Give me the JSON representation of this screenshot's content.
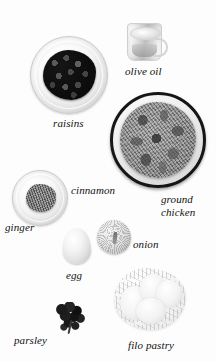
{
  "scene": {
    "title": "Ingredients layout",
    "background_color": "#fdfdfd",
    "label_color": "#111111",
    "style": "black-and-white cookbook ingredient photo with italic serif captions"
  },
  "ingredients": [
    {
      "id": "raisins",
      "label": "raisins",
      "vessel": "glass bowl",
      "icon": "raisins-bowl-icon",
      "label_position": {
        "left": 53,
        "top": 118
      },
      "label_size": 11
    },
    {
      "id": "olive-oil",
      "label": "olive oil",
      "vessel": "glass measuring jug",
      "icon": "olive-oil-jug-icon",
      "label_position": {
        "left": 125,
        "top": 66
      },
      "label_size": 11
    },
    {
      "id": "ground-chicken",
      "label": "ground\nchicken",
      "label_line1": "ground",
      "label_line2": "chicken",
      "vessel": "dark-rimmed bowl",
      "icon": "ground-chicken-bowl-icon",
      "label_position": {
        "left": 161,
        "top": 194
      },
      "label_size": 11
    },
    {
      "id": "ginger",
      "label": "ginger",
      "vessel": "glass bowl",
      "icon": "ginger-bowl-icon",
      "label_position": {
        "left": 5,
        "top": 222
      },
      "label_size": 11
    },
    {
      "id": "cinnamon",
      "label": "cinnamon",
      "vessel": "none",
      "icon": "cinnamon-icon",
      "label_position": {
        "left": 71,
        "top": 185
      },
      "label_size": 11
    },
    {
      "id": "egg",
      "label": "egg",
      "vessel": "none",
      "icon": "egg-icon",
      "label_position": {
        "left": 66,
        "top": 270
      },
      "label_size": 11
    },
    {
      "id": "onion",
      "label": "onion",
      "vessel": "none",
      "icon": "onion-icon",
      "label_position": {
        "left": 133,
        "top": 239
      },
      "label_size": 11
    },
    {
      "id": "parsley",
      "label": "parsley",
      "vessel": "none",
      "icon": "parsley-sprig-icon",
      "label_position": {
        "left": 14,
        "top": 335
      },
      "label_size": 11
    },
    {
      "id": "filo-pastry",
      "label": "filo pastry",
      "vessel": "none",
      "icon": "filo-pastry-icon",
      "label_position": {
        "left": 128,
        "top": 340
      },
      "label_size": 11
    }
  ]
}
